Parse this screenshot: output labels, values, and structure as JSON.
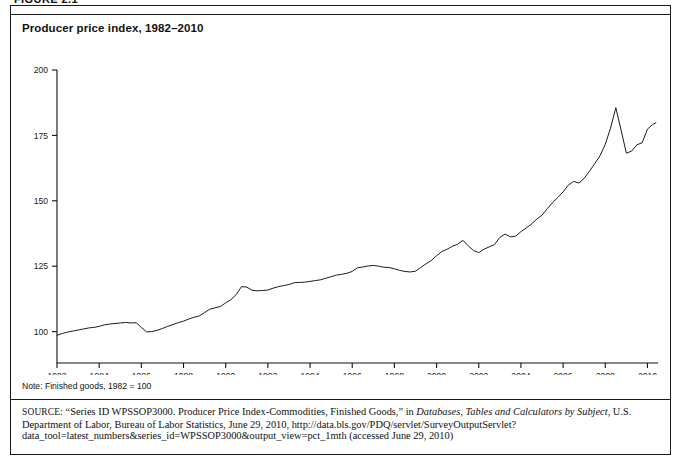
{
  "figure": {
    "label": "FIGURE 2.1"
  },
  "title": "Producer price index, 1982–2010",
  "note": "Note: Finished goods, 1982 = 100",
  "source": {
    "prefix": "SOURCE:",
    "part1": " “Series ID WPSSOP3000. Producer Price Index-Commodities, Finished Goods,” in ",
    "italic1": "Databases, Tables and Calculators by Subject",
    "part2": ", U.S. Department of Labor, Bureau of Labor Statistics, June 29, 2010, http://data.bls.gov/PDQ/servlet/SurveyOutputServlet?data_tool=latest_numbers&series_id=WPSSOP3000&output_view=pct_1mth (accessed June 29, 2010)"
  },
  "chart_data": {
    "type": "line",
    "title": "Producer price index, 1982–2010",
    "xlabel": "",
    "ylabel": "",
    "xlim": [
      1982,
      2010.5
    ],
    "ylim": [
      88,
      200
    ],
    "grid": false,
    "legend": "none",
    "line_color": "#1b1b1b",
    "yticks": [
      100,
      125,
      150,
      175,
      200
    ],
    "ytick_labels": [
      "100",
      "125",
      "150",
      "175",
      "200"
    ],
    "xticks": [
      1982,
      1984,
      1986,
      1988,
      1990,
      1992,
      1994,
      1996,
      1998,
      2000,
      2002,
      2004,
      2006,
      2008,
      2010
    ],
    "xtick_labels": [
      "1982",
      "1984",
      "1986",
      "1988",
      "1990",
      "1992",
      "1994",
      "1996",
      "1998",
      "2000",
      "2002",
      "2004",
      "2006",
      "2008",
      "2010"
    ],
    "series": [
      {
        "name": "Producer price index, finished goods (1982 = 100)",
        "x": [
          1982.0,
          1982.25,
          1982.5,
          1982.75,
          1983.0,
          1983.25,
          1983.5,
          1983.75,
          1984.0,
          1984.25,
          1984.5,
          1984.75,
          1985.0,
          1985.25,
          1985.5,
          1985.75,
          1986.0,
          1986.25,
          1986.5,
          1986.75,
          1987.0,
          1987.25,
          1987.5,
          1987.75,
          1988.0,
          1988.25,
          1988.5,
          1988.75,
          1989.0,
          1989.25,
          1989.5,
          1989.75,
          1990.0,
          1990.25,
          1990.5,
          1990.75,
          1991.0,
          1991.25,
          1991.5,
          1991.75,
          1992.0,
          1992.25,
          1992.5,
          1992.75,
          1993.0,
          1993.25,
          1993.5,
          1993.75,
          1994.0,
          1994.25,
          1994.5,
          1994.75,
          1995.0,
          1995.25,
          1995.5,
          1995.75,
          1996.0,
          1996.25,
          1996.5,
          1996.75,
          1997.0,
          1997.25,
          1997.5,
          1997.75,
          1998.0,
          1998.25,
          1998.5,
          1998.75,
          1999.0,
          1999.25,
          1999.5,
          1999.75,
          2000.0,
          2000.25,
          2000.5,
          2000.75,
          2001.0,
          2001.25,
          2001.5,
          2001.75,
          2002.0,
          2002.25,
          2002.5,
          2002.75,
          2003.0,
          2003.25,
          2003.5,
          2003.75,
          2004.0,
          2004.25,
          2004.5,
          2004.75,
          2005.0,
          2005.25,
          2005.5,
          2005.75,
          2006.0,
          2006.25,
          2006.5,
          2006.75,
          2007.0,
          2007.25,
          2007.5,
          2007.75,
          2008.0,
          2008.25,
          2008.5,
          2008.75,
          2009.0,
          2009.25,
          2009.5,
          2009.75,
          2010.0,
          2010.25,
          2010.4
        ],
        "y": [
          98.6,
          99.3,
          99.8,
          100.2,
          100.6,
          101.0,
          101.4,
          101.6,
          102.0,
          102.6,
          102.9,
          103.1,
          103.3,
          103.5,
          103.3,
          103.4,
          101.6,
          99.9,
          100.0,
          100.5,
          101.2,
          102.0,
          102.7,
          103.4,
          104.0,
          104.8,
          105.5,
          106.0,
          107.3,
          108.6,
          109.1,
          109.6,
          111.0,
          112.2,
          114.2,
          117.2,
          117.0,
          115.8,
          115.6,
          115.7,
          115.9,
          116.6,
          117.2,
          117.6,
          118.0,
          118.7,
          118.8,
          118.9,
          119.2,
          119.5,
          119.8,
          120.4,
          121.0,
          121.6,
          121.9,
          122.3,
          123.0,
          124.4,
          124.7,
          125.1,
          125.3,
          125.0,
          124.6,
          124.5,
          124.0,
          123.4,
          123.0,
          122.8,
          123.1,
          124.5,
          125.9,
          127.2,
          129.0,
          130.6,
          131.5,
          132.6,
          133.4,
          134.9,
          132.8,
          131.0,
          130.2,
          131.5,
          132.4,
          133.3,
          136.0,
          137.3,
          136.2,
          136.5,
          138.2,
          139.6,
          141.1,
          143.0,
          144.5,
          147.0,
          149.3,
          151.3,
          153.4,
          156.0,
          157.4,
          156.8,
          158.6,
          161.3,
          164.2,
          167.2,
          171.6,
          177.8,
          185.6,
          177.0,
          168.2,
          169.0,
          171.4,
          172.2,
          177.4,
          179.2,
          179.8
        ]
      }
    ]
  }
}
